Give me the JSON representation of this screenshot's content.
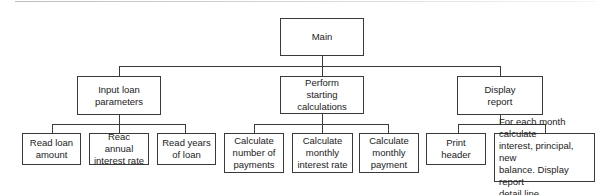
{
  "diagram": {
    "type": "hierarchy-chart",
    "root": {
      "label": "Main",
      "children": [
        {
          "label": "Input loan\nparameters",
          "children": [
            {
              "label": "Read loan\namount"
            },
            {
              "label": "Reac annual\ninterest rate"
            },
            {
              "label": "Read years\nof loan"
            }
          ]
        },
        {
          "label": "Perform\nstarting\ncalculations",
          "children": [
            {
              "label": "Calculate\nnumber of\npayments"
            },
            {
              "label": "Calculate\nmonthly\ninterest rate"
            },
            {
              "label": "Calculate\nmonthly\npayment"
            }
          ]
        },
        {
          "label": "Display\nreport",
          "children": [
            {
              "label": "Print\nheader"
            },
            {
              "label": "For each month calculate\ninterest, principal, new\nbalance. Display report\ndetail line"
            }
          ]
        }
      ]
    },
    "colors": {
      "line": "#3a3a3a",
      "box_fill": "#ffffff",
      "text": "#222222"
    }
  }
}
